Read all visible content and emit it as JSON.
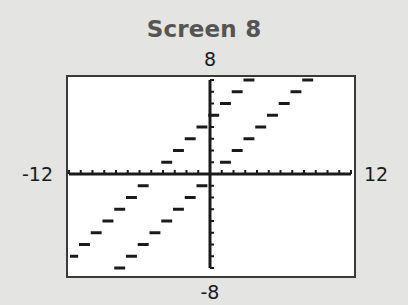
{
  "title": "Screen 8",
  "window": {
    "xmin_label": "-12",
    "xmax_label": "12",
    "ymin_label": "-8",
    "ymax_label": "8"
  },
  "colors": {
    "background": "#e4e4e2",
    "screen": "#ffffff",
    "border": "#3a3a3a",
    "ink": "#1a1a1a",
    "title": "#555555"
  },
  "chart_data": {
    "type": "scatter",
    "title": "Screen 8",
    "xlabel": "",
    "ylabel": "",
    "xlim": [
      -12,
      12
    ],
    "ylim": [
      -8,
      8
    ],
    "xscl": 1,
    "yscl": 1,
    "grid": false,
    "legend": null,
    "tick_labels": {
      "xmin": "-12",
      "xmax": "12",
      "ymin": "-8",
      "ymax": "8"
    },
    "series": [
      {
        "name": "y = [x]",
        "segments": [
          {
            "x": -8,
            "y": -8
          },
          {
            "x": -7,
            "y": -7
          },
          {
            "x": -6,
            "y": -6
          },
          {
            "x": -5,
            "y": -5
          },
          {
            "x": -4,
            "y": -4
          },
          {
            "x": -3,
            "y": -3
          },
          {
            "x": -2,
            "y": -2
          },
          {
            "x": -1,
            "y": -1
          },
          {
            "x": 0,
            "y": 0
          },
          {
            "x": 1,
            "y": 1
          },
          {
            "x": 2,
            "y": 2
          },
          {
            "x": 3,
            "y": 3
          },
          {
            "x": 4,
            "y": 4
          },
          {
            "x": 5,
            "y": 5
          },
          {
            "x": 6,
            "y": 6
          },
          {
            "x": 7,
            "y": 7
          },
          {
            "x": 8,
            "y": 8
          }
        ]
      },
      {
        "name": "y = [x] + 5",
        "segments": [
          {
            "x": -12,
            "y": -7
          },
          {
            "x": -11,
            "y": -6
          },
          {
            "x": -10,
            "y": -5
          },
          {
            "x": -9,
            "y": -4
          },
          {
            "x": -8,
            "y": -3
          },
          {
            "x": -7,
            "y": -2
          },
          {
            "x": -6,
            "y": -1
          },
          {
            "x": -5,
            "y": 0
          },
          {
            "x": -4,
            "y": 1
          },
          {
            "x": -3,
            "y": 2
          },
          {
            "x": -2,
            "y": 3
          },
          {
            "x": -1,
            "y": 4
          },
          {
            "x": 0,
            "y": 5
          },
          {
            "x": 1,
            "y": 6
          },
          {
            "x": 2,
            "y": 7
          },
          {
            "x": 3,
            "y": 8
          }
        ]
      }
    ]
  }
}
